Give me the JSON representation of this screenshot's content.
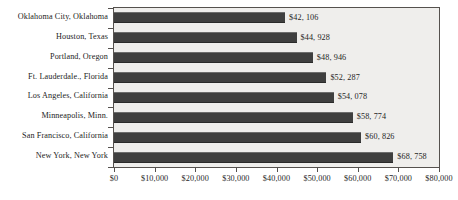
{
  "chart_data": {
    "type": "bar",
    "orientation": "horizontal",
    "title": "",
    "xlabel": "",
    "ylabel": "",
    "xlim": [
      0,
      80000
    ],
    "grid": false,
    "legend": null,
    "bar_color": "#3f3f3f",
    "plot_background": "#efeeec",
    "categories": [
      "Oklahoma City, Oklahoma",
      "Houston, Texas",
      "Portland, Oregon",
      "Ft. Lauderdale., Florida",
      "Los Angeles, California",
      "Minneapolis, Minn.",
      "San Francisco, California",
      "New York, New York"
    ],
    "values": [
      42106,
      44928,
      48946,
      52287,
      54078,
      58774,
      60826,
      68758
    ],
    "data_labels": [
      "$42, 106",
      "$44, 928",
      "$48, 946",
      "$52, 287",
      "$54, 078",
      "$58, 774",
      "$60, 826",
      "$68, 758"
    ],
    "xticks": [
      0,
      10000,
      20000,
      30000,
      40000,
      50000,
      60000,
      70000,
      80000
    ],
    "xticklabels": [
      "$0",
      "$10,000",
      "$20,000",
      "$30,000",
      "$40,000",
      "$50,000",
      "$60,000",
      "$70,000",
      "$80,000"
    ]
  }
}
